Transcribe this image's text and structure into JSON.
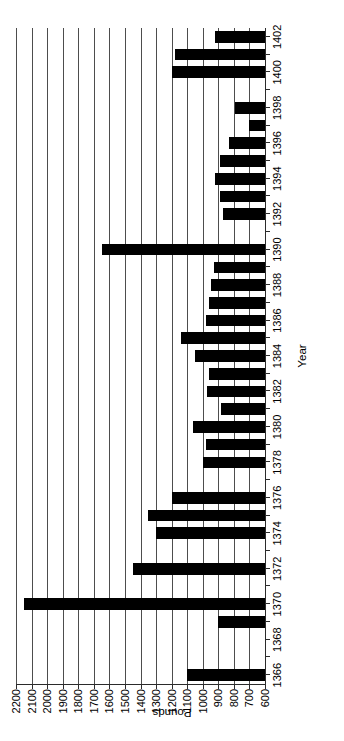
{
  "chart_data": {
    "type": "bar",
    "orientation": "horizontal",
    "title": "",
    "xlabel": "Year",
    "ylabel": "Pounds",
    "grid": true,
    "legend": null,
    "value_axis": {
      "label": "Pounds",
      "min": 600,
      "max": 2200,
      "reversed": true,
      "tick_step": 100,
      "ticks": [
        2200,
        2100,
        2000,
        1900,
        1800,
        1700,
        1600,
        1500,
        1400,
        1300,
        1200,
        1100,
        1000,
        900,
        800,
        700,
        600
      ],
      "tick_labels": [
        "2200",
        "2100",
        "2000",
        "1900",
        "1800",
        "1700",
        "1600",
        "1500",
        "1400",
        "1300",
        "1200",
        "1100",
        "1000",
        "900",
        "800",
        "700",
        "600"
      ],
      "baseline": 600
    },
    "category_axis": {
      "label": "Year",
      "min": 1366,
      "max": 1402,
      "tick_step": 1,
      "labelled_step": 2,
      "labelled_ticks": [
        1366,
        1368,
        1370,
        1372,
        1374,
        1376,
        1378,
        1380,
        1382,
        1384,
        1386,
        1388,
        1390,
        1392,
        1394,
        1396,
        1398,
        1400,
        1402
      ],
      "labelled_tick_labels": [
        "1366",
        "1368",
        "1370",
        "1372",
        "1374",
        "1376",
        "1378",
        "1380",
        "1382",
        "1384",
        "1386",
        "1388",
        "1390",
        "1392",
        "1394",
        "1396",
        "1398",
        "1400",
        "1402"
      ]
    },
    "categories": [
      1366,
      1367,
      1368,
      1369,
      1370,
      1371,
      1372,
      1373,
      1374,
      1375,
      1376,
      1377,
      1378,
      1379,
      1380,
      1381,
      1382,
      1383,
      1384,
      1385,
      1386,
      1387,
      1388,
      1389,
      1390,
      1391,
      1392,
      1393,
      1394,
      1395,
      1396,
      1397,
      1398,
      1399,
      1400,
      1401,
      1402
    ],
    "values": [
      1100,
      600,
      600,
      900,
      2150,
      600,
      1450,
      600,
      1300,
      1350,
      1200,
      600,
      1000,
      980,
      1060,
      880,
      970,
      960,
      1050,
      1140,
      980,
      960,
      950,
      930,
      1650,
      600,
      870,
      890,
      920,
      890,
      830,
      700,
      790,
      600,
      1200,
      1180,
      920
    ],
    "bar_color": "#000000"
  },
  "axis_titles": {
    "value": "Pounds",
    "category": "Year"
  }
}
